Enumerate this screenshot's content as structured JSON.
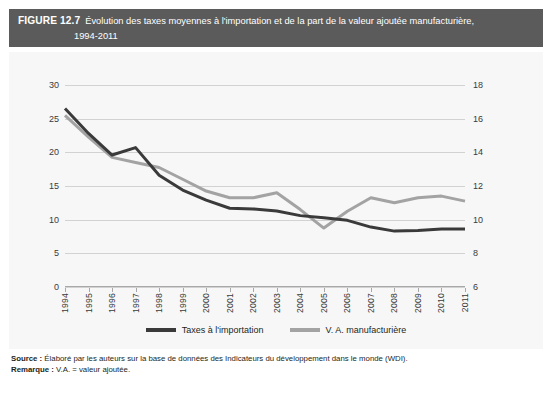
{
  "header": {
    "figure_number": "FIGURE 12.7",
    "title_line1": "Évolution des taxes moyennes à l'importation et de la part de la valeur ajoutée manufacturière,",
    "title_line2": "1994-2011",
    "background_color": "#5b5b5b",
    "text_color": "#ffffff"
  },
  "panel": {
    "background_color": "#f7f7f7"
  },
  "legend": {
    "position": "bottom-center",
    "items": [
      {
        "label": "Taxes à l'importation",
        "color": "#3a3a3a"
      },
      {
        "label": "V. A. manufacturière",
        "color": "#a3a3a3"
      }
    ]
  },
  "notes": {
    "source_key": "Source :",
    "source_text": " Élaboré par les auteurs sur la base de données des Indicateurs du développement dans le monde (WDI).",
    "remark_key": "Remarque :",
    "remark_text": " V.A. = valeur ajoutée."
  },
  "chart_data": {
    "type": "line",
    "title": "Évolution des taxes moyennes à l'importation et de la part de la valeur ajoutée manufacturière, 1994-2011",
    "xlabel": "",
    "ylabel": "",
    "grid": true,
    "legend_position": "bottom-center",
    "x": [
      "1994",
      "1995",
      "1996",
      "1997",
      "1998",
      "1999",
      "2000",
      "2001",
      "2002",
      "2003",
      "2004",
      "2005",
      "2006",
      "2007",
      "2008",
      "2009",
      "2010",
      "2011"
    ],
    "axes": {
      "left": {
        "ylim": [
          0,
          30
        ],
        "ticks": [
          0,
          5,
          10,
          15,
          20,
          25,
          30
        ],
        "tick_labels": [
          "0",
          "5",
          "10",
          "15",
          "20",
          "25",
          "30"
        ],
        "series": "Taxes à l'importation"
      },
      "right": {
        "ylim": [
          6,
          18
        ],
        "ticks": [
          6,
          8,
          10,
          12,
          14,
          16,
          18
        ],
        "tick_labels": [
          "6",
          "8",
          "10",
          "12",
          "14",
          "16",
          "18"
        ],
        "series": "V. A. manufacturière"
      }
    },
    "series": [
      {
        "name": "Taxes à l'importation",
        "axis": "left",
        "color": "#3a3a3a",
        "values": [
          26.5,
          22.8,
          19.6,
          20.7,
          16.6,
          14.4,
          12.9,
          11.7,
          11.6,
          11.3,
          10.6,
          10.3,
          9.9,
          8.9,
          8.3,
          8.4,
          8.6,
          8.6
        ]
      },
      {
        "name": "V. A. manufacturière",
        "axis": "right",
        "color": "#a3a3a3",
        "values": [
          16.2,
          14.9,
          13.7,
          13.4,
          13.1,
          12.4,
          11.7,
          11.3,
          11.3,
          11.6,
          10.6,
          9.5,
          10.5,
          11.3,
          11.0,
          11.3,
          11.4,
          11.1
        ]
      }
    ]
  }
}
